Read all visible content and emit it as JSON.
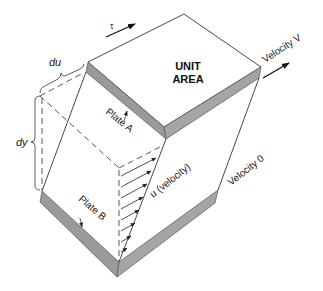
{
  "diagram": {
    "type": "fluid-shear-block",
    "labels": {
      "tau": "τ",
      "unit_area_line1": "UNIT",
      "unit_area_line2": "AREA",
      "velocity_v": "Velocity V",
      "velocity_0": "Velocity 0",
      "plate_a": "Plate A",
      "plate_b": "Plate B",
      "u_velocity": "u (velocity)",
      "du": "du",
      "dy": "dy"
    },
    "colors": {
      "line": "#333333",
      "plate_fill": "#9a9a9a",
      "plate_edge": "#555555",
      "background": "#ffffff",
      "text": "#1a1a1a"
    },
    "velocity_profile_arrows": 8
  }
}
